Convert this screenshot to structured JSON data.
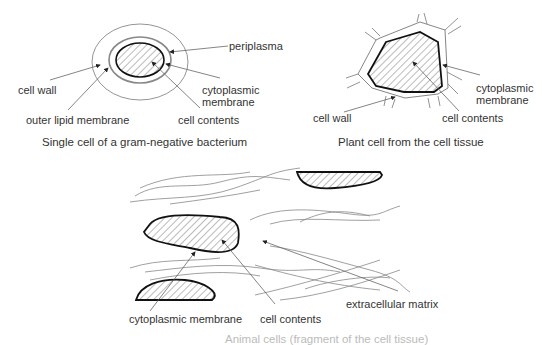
{
  "panels": {
    "bacterium": {
      "caption": "Single cell of a gram-negative bacterium",
      "labels": {
        "periplasma": "periplasma",
        "cell_wall": "cell wall",
        "cytoplasmic_membrane_line1": "cytoplasmic",
        "cytoplasmic_membrane_line2": "membrane",
        "outer_lipid_membrane": "outer lipid membrane",
        "cell_contents": "cell contents"
      }
    },
    "plant_cell": {
      "caption": "Plant cell from the cell tissue",
      "labels": {
        "cytoplasmic_membrane_line1": "cytoplasmic",
        "cytoplasmic_membrane_line2": "membrane",
        "cell_wall": "cell wall",
        "cell_contents": "cell contents"
      }
    },
    "animal_tissue": {
      "caption": "Animal cells (fragment of the cell tissue)",
      "labels": {
        "cytoplasmic_membrane": "cytoplasmic membrane",
        "cell_contents": "cell contents",
        "extracellular_matrix": "extracellular matrix"
      }
    }
  },
  "colors": {
    "outline": "#111111",
    "thin_line": "#888888",
    "hatch": "#555555",
    "text": "#333333"
  }
}
